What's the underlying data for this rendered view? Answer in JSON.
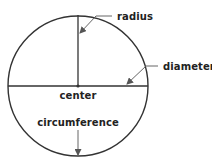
{
  "diagram": {
    "colors": {
      "stroke": "#333333",
      "leader": "#555555",
      "text": "#222222",
      "background": "#ffffff"
    },
    "circle": {
      "cx": 78,
      "cy": 86,
      "r": 70
    },
    "labels": {
      "radius": "radius",
      "diameter": "diameter",
      "center": "center",
      "circumference": "circumference"
    }
  }
}
